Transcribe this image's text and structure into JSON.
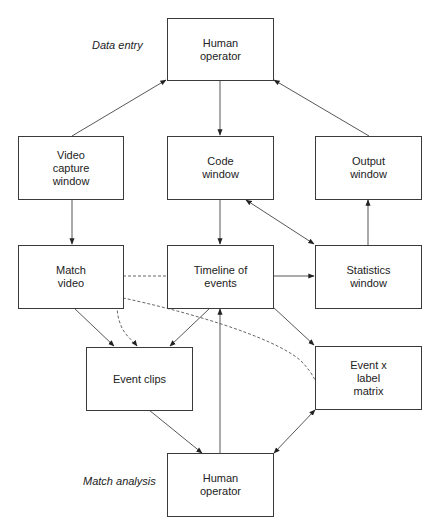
{
  "diagram": {
    "type": "flowchart",
    "phase_labels": {
      "data_entry": "Data entry",
      "match_analysis": "Match analysis"
    },
    "nodes": {
      "human_operator_top": "Human\noperator",
      "video_capture": "Video\ncapture\nwindow",
      "code_window": "Code\nwindow",
      "output_window": "Output\nwindow",
      "match_video": "Match\nvideo",
      "timeline": "Timeline of\nevents",
      "statistics": "Statistics\nwindow",
      "event_clips": "Event clips",
      "event_matrix": "Event x\nlabel\nmatrix",
      "human_operator_bottom": "Human\noperator"
    },
    "edges": [
      {
        "from": "video_capture",
        "to": "human_operator_top",
        "style": "solid"
      },
      {
        "from": "human_operator_top",
        "to": "code_window",
        "style": "solid"
      },
      {
        "from": "output_window",
        "to": "human_operator_top",
        "style": "solid"
      },
      {
        "from": "video_capture",
        "to": "match_video",
        "style": "solid"
      },
      {
        "from": "code_window",
        "to": "timeline",
        "style": "solid"
      },
      {
        "from": "code_window",
        "to": "statistics",
        "style": "solid",
        "bidirectional": true
      },
      {
        "from": "statistics",
        "to": "output_window",
        "style": "solid"
      },
      {
        "from": "timeline",
        "to": "statistics",
        "style": "solid"
      },
      {
        "from": "match_video",
        "to": "timeline",
        "style": "dashed",
        "arrow": false
      },
      {
        "from": "match_video",
        "to": "event_clips",
        "style": "solid"
      },
      {
        "from": "match_video",
        "to": "event_clips",
        "style": "dashed"
      },
      {
        "from": "event_matrix",
        "to": "match_video",
        "style": "dashed",
        "arrow": false
      },
      {
        "from": "timeline",
        "to": "event_clips",
        "style": "solid"
      },
      {
        "from": "timeline",
        "to": "event_matrix",
        "style": "solid"
      },
      {
        "from": "event_clips",
        "to": "human_operator_bottom",
        "style": "solid"
      },
      {
        "from": "human_operator_bottom",
        "to": "timeline",
        "style": "solid"
      },
      {
        "from": "event_matrix",
        "to": "human_operator_bottom",
        "style": "solid",
        "bidirectional": true
      }
    ]
  }
}
